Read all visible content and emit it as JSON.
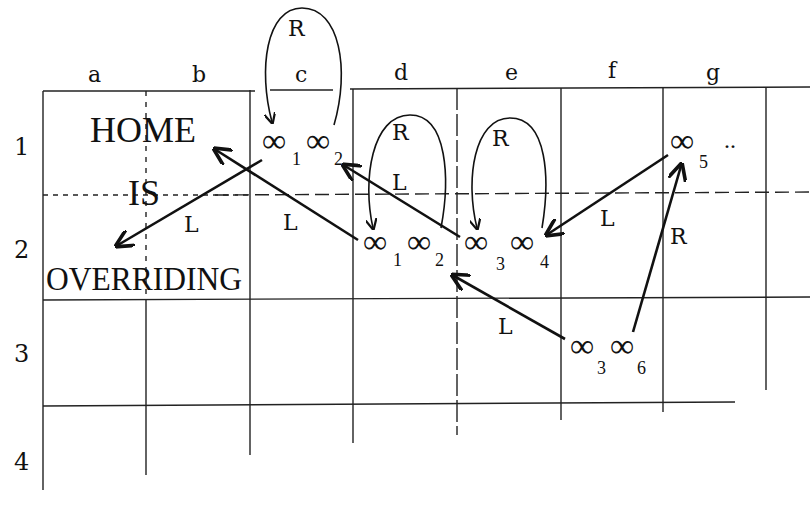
{
  "diagram": {
    "type": "cellular-automaton-tape",
    "columns": [
      "a",
      "b",
      "c",
      "d",
      "e",
      "f",
      "g"
    ],
    "rows": [
      "1",
      "2",
      "3",
      "4"
    ],
    "phrase": {
      "word1": "HOME",
      "word2": "IS",
      "word3": "OVERRIDING"
    },
    "cells": {
      "c1": {
        "t1": "∞",
        "s1": "1",
        "t2": "∞",
        "s2": "2"
      },
      "d2": {
        "t1": "∞",
        "s1": "1",
        "t2": "∞",
        "s2": "2"
      },
      "e2": {
        "t1": "∞",
        "s1": "3",
        "t2": "∞",
        "s2": "4"
      },
      "g1": {
        "t1": "∞",
        "s1": "5",
        "ellipsis": ".."
      },
      "f3": {
        "t1": "∞",
        "s1": "3",
        "t2": "∞",
        "s2": "6"
      }
    },
    "arrows": [
      {
        "from": "c1",
        "to": "c1",
        "label": "R",
        "shape": "loop"
      },
      {
        "from": "c1",
        "to": "a2",
        "label": "L"
      },
      {
        "from": "d2",
        "to": "b1",
        "label": "L"
      },
      {
        "from": "e2",
        "to": "c1",
        "label": "L"
      },
      {
        "from": "d2",
        "to": "d2",
        "label": "R",
        "shape": "loop"
      },
      {
        "from": "e2",
        "to": "e2",
        "label": "R",
        "shape": "loop"
      },
      {
        "from": "g1",
        "to": "e2",
        "label": "L"
      },
      {
        "from": "f3",
        "to": "g1",
        "label": "R"
      },
      {
        "from": "f3",
        "to": "d2",
        "label": "L"
      }
    ]
  }
}
